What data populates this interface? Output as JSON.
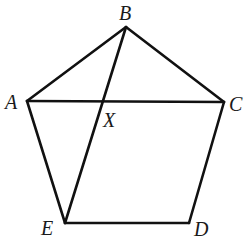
{
  "diagram": {
    "type": "geometry",
    "shape": "pentagon ABCDE with diagonals AC and BE intersecting at X",
    "colors": {
      "stroke": "#111111",
      "label": "#1a1a1a",
      "background": "#ffffff"
    },
    "points": {
      "A": {
        "x": 27,
        "y": 101
      },
      "B": {
        "x": 126,
        "y": 27
      },
      "C": {
        "x": 224,
        "y": 102
      },
      "D": {
        "x": 189,
        "y": 223
      },
      "E": {
        "x": 65,
        "y": 223
      },
      "X": {
        "x": 103,
        "y": 101
      }
    },
    "segments": [
      {
        "from": "A",
        "to": "B"
      },
      {
        "from": "B",
        "to": "C"
      },
      {
        "from": "C",
        "to": "D"
      },
      {
        "from": "D",
        "to": "E"
      },
      {
        "from": "E",
        "to": "A"
      },
      {
        "from": "A",
        "to": "C"
      },
      {
        "from": "B",
        "to": "E"
      }
    ],
    "labels": {
      "A": "A",
      "B": "B",
      "C": "C",
      "D": "D",
      "E": "E",
      "X": "X"
    }
  }
}
